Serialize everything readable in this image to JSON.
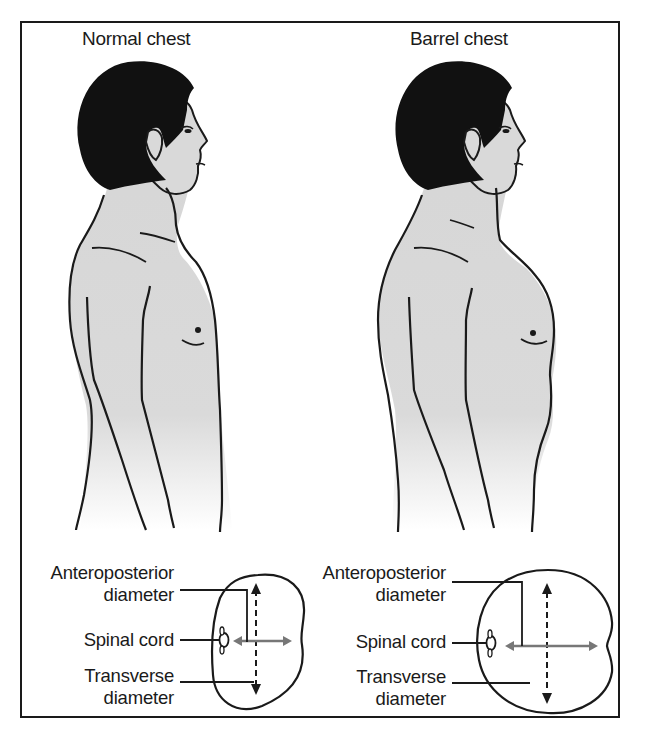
{
  "figure": {
    "panels": [
      {
        "title": "Normal chest",
        "labels": {
          "ap_line1": "Anteroposterior",
          "ap_line2": "diameter",
          "spinal": "Spinal cord",
          "tr_line1": "Transverse",
          "tr_line2": "diameter"
        }
      },
      {
        "title": "Barrel chest",
        "labels": {
          "ap_line1": "Anteroposterior",
          "ap_line2": "diameter",
          "spinal": "Spinal cord",
          "tr_line1": "Transverse",
          "tr_line2": "diameter"
        }
      }
    ],
    "colors": {
      "skin": "#d9d9d9",
      "hair": "#111111",
      "outline": "#1a1a1a",
      "arrow_gray": "#777777",
      "background": "#ffffff"
    }
  }
}
